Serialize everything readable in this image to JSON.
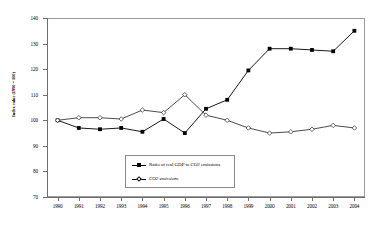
{
  "chart_data": {
    "type": "line",
    "title": "",
    "xlabel": "",
    "ylabel": "Index value (1990 = 100)",
    "ylim": [
      70,
      140
    ],
    "yticks": [
      70,
      80,
      90,
      100,
      110,
      120,
      130,
      140
    ],
    "ytick_labels": [
      "70",
      "80",
      "90",
      "100",
      "110",
      "120",
      "130",
      "140"
    ],
    "categories": [
      "1990",
      "1991",
      "1992",
      "1993",
      "1994",
      "1995",
      "1996",
      "1997",
      "1998",
      "1999",
      "2000",
      "2001",
      "2002",
      "2003",
      "2004"
    ],
    "x": [
      1990,
      1991,
      1992,
      1993,
      1994,
      1995,
      1996,
      1997,
      1998,
      1999,
      2000,
      2001,
      2002,
      2003,
      2004
    ],
    "grid": false,
    "legend_position": "inside-lower-center",
    "series": [
      {
        "name": "Ratio of real GDP to CO2 emissions",
        "marker": "filled-square",
        "values": [
          100,
          97,
          96.5,
          97,
          95.5,
          100.5,
          95,
          104.5,
          108,
          119.5,
          128,
          128,
          127.5,
          127,
          135
        ]
      },
      {
        "name": "CO2 emissions",
        "marker": "open-diamond",
        "values": [
          100,
          101,
          101,
          100.5,
          104,
          103,
          110,
          102,
          100,
          97,
          95,
          95.5,
          96.5,
          98,
          97
        ]
      }
    ]
  },
  "legend": {
    "items": [
      {
        "label": "Ratio of real GDP to CO2 emissions"
      },
      {
        "label": "CO2 emissions"
      }
    ]
  }
}
